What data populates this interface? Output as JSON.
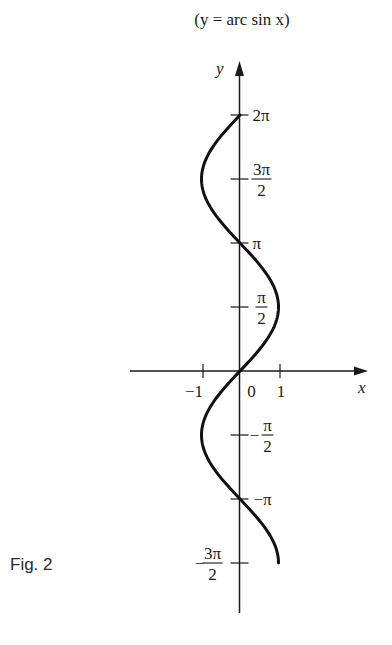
{
  "chart_data": {
    "type": "line",
    "title": "(y = arc sin x)",
    "caption": "Fig. 2",
    "xlabel": "x",
    "ylabel": "y",
    "xlim": [
      -1.5,
      3.3
    ],
    "ylim_multiples_of_pi_over_2": [
      -3,
      4
    ],
    "x_ticks": [
      {
        "value": -1,
        "label": "−1"
      },
      {
        "value": 0,
        "label": "0"
      },
      {
        "value": 1,
        "label": "1"
      }
    ],
    "y_ticks": [
      {
        "value_pi_over_2": 4,
        "label": "2π",
        "fraction": false
      },
      {
        "value_pi_over_2": 3,
        "num": "3π",
        "den": "2",
        "sign": "",
        "fraction": true
      },
      {
        "value_pi_over_2": 2,
        "label": "π",
        "fraction": false
      },
      {
        "value_pi_over_2": 1,
        "num": "π",
        "den": "2",
        "sign": "",
        "fraction": true
      },
      {
        "value_pi_over_2": -1,
        "num": "π",
        "den": "2",
        "sign": "−",
        "fraction": true
      },
      {
        "value_pi_over_2": -2,
        "label": "−π",
        "fraction": false
      },
      {
        "value_pi_over_2": -3,
        "num": "3π",
        "den": "2",
        "sign": "−",
        "fraction": true
      }
    ],
    "series": [
      {
        "name": "x = sin y",
        "relation": "x = sin(y)",
        "y_range": [
          "-3π/2",
          "2π"
        ],
        "key_points": [
          {
            "x": 1,
            "y": "-3π/2"
          },
          {
            "x": 0,
            "y": "-π"
          },
          {
            "x": -1,
            "y": "-π/2"
          },
          {
            "x": 0,
            "y": "0"
          },
          {
            "x": 1,
            "y": "π/2"
          },
          {
            "x": 0,
            "y": "π"
          },
          {
            "x": -1,
            "y": "3π/2"
          },
          {
            "x": 0,
            "y": "2π"
          }
        ]
      }
    ],
    "grid": false,
    "legend": "none"
  }
}
